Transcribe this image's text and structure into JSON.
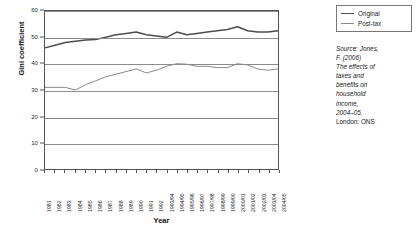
{
  "chart_data": {
    "type": "line",
    "title": "",
    "xlabel": "Year",
    "ylabel": "Gini coefficient",
    "ylim": [
      0,
      60
    ],
    "yticks": [
      0,
      10,
      20,
      30,
      40,
      50,
      60
    ],
    "grid": true,
    "legend_position": "top-right-outside",
    "categories": [
      "1981",
      "1982",
      "1983",
      "1984",
      "1985",
      "1986",
      "1987",
      "1988",
      "1989",
      "1990",
      "1991",
      "1992",
      "1993/94",
      "1994/95",
      "1995/96",
      "1996/97",
      "1997/98",
      "1998/99",
      "1999/00",
      "2000/01",
      "2001/02",
      "2002/03",
      "2003/04",
      "2004/05"
    ],
    "series": [
      {
        "name": "Original",
        "color": "#4d4d4d",
        "width": 1.5,
        "values": [
          46,
          47,
          48,
          48.5,
          49,
          49.2,
          50,
          51,
          51.5,
          52,
          51,
          50.5,
          50,
          52,
          51,
          51.5,
          52,
          52.5,
          53,
          54,
          52.5,
          52,
          52,
          52.5
        ]
      },
      {
        "name": "Post-tax",
        "color": "#8a8a8a",
        "width": 1,
        "values": [
          31,
          31,
          31,
          30,
          32,
          33.5,
          35,
          36,
          37,
          38,
          36.5,
          37.5,
          39,
          40,
          39.8,
          39,
          39,
          38.5,
          38.5,
          40,
          39.5,
          38,
          37.5,
          38
        ]
      }
    ],
    "annotations": [
      {
        "name": "source-note",
        "segments": [
          {
            "text": "Source: Jones, F. (2006) ",
            "style": "italic"
          },
          {
            "text": "The effects of taxes and benefits on household income, 2004–05. ",
            "style": "italic"
          },
          {
            "text": "London: ONS",
            "style": "normal"
          }
        ]
      }
    ]
  },
  "legend": {
    "items": [
      {
        "label": "Original"
      },
      {
        "label": "Post-tax"
      }
    ]
  },
  "source": {
    "line1": "Source: Jones,",
    "line2": "F. (2006)",
    "line3": "The effects of",
    "line4": "taxes and",
    "line5": "benefits on",
    "line6": "household",
    "line7": "income,",
    "line8": "2004–05.",
    "line9": "London: ONS"
  }
}
